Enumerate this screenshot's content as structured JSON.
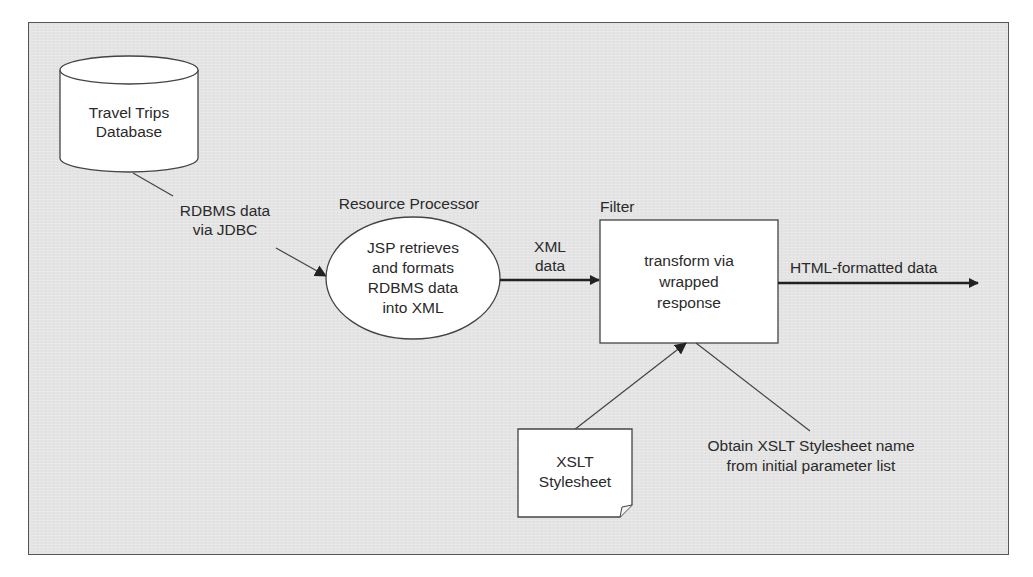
{
  "diagram": {
    "type": "data-flow",
    "background_color": "#e4e4e4",
    "node_fill": "#ffffff",
    "stroke_color": "#333333",
    "nodes": {
      "database": {
        "shape": "cylinder",
        "line1": "Travel Trips",
        "line2": "Database"
      },
      "resource_processor": {
        "shape": "ellipse",
        "title": "Resource Processor",
        "line1": "JSP retrieves",
        "line2": "and formats",
        "line3": "RDBMS data",
        "line4": "into XML"
      },
      "filter": {
        "shape": "rectangle",
        "title": "Filter",
        "line1": "transform via",
        "line2": "wrapped",
        "line3": "response"
      },
      "xslt_stylesheet": {
        "shape": "document",
        "line1": "XSLT",
        "line2": "Stylesheet"
      }
    },
    "edges": {
      "db_to_processor": {
        "line1": "RDBMS data",
        "line2": "via JDBC"
      },
      "processor_to_filter": {
        "line1": "XML",
        "line2": "data"
      },
      "filter_output": {
        "label": "HTML-formatted data"
      },
      "stylesheet_to_filter": {
        "label": ""
      },
      "annotation": {
        "line1": "Obtain XSLT Stylesheet name",
        "line2": "from initial parameter list"
      }
    }
  }
}
